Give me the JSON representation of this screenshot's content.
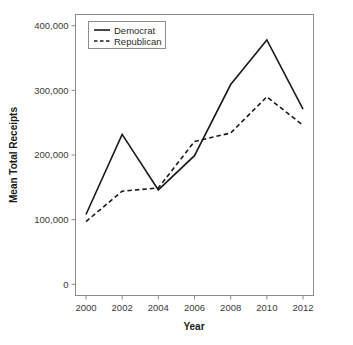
{
  "chart_data": {
    "type": "line",
    "title": "",
    "xlabel": "Year",
    "ylabel": "Mean Total Receipts",
    "x": [
      2000,
      2002,
      2004,
      2006,
      2008,
      2010,
      2012
    ],
    "xtick_labels": [
      "2000",
      "2002",
      "2004",
      "2006",
      "2008",
      "2010",
      "2012"
    ],
    "ytick_labels": [
      "0",
      "100,000",
      "200,000",
      "300,000",
      "400,000"
    ],
    "ytick_values": [
      0,
      100000,
      200000,
      300000,
      400000
    ],
    "xlim": [
      2000,
      2012
    ],
    "ylim": [
      0,
      400000
    ],
    "grid": false,
    "legend_position": "top-left",
    "series": [
      {
        "name": "Democrat",
        "style": "solid",
        "color": "#1a1a1a",
        "values": [
          108000,
          232000,
          146000,
          199000,
          309000,
          378000,
          271000
        ]
      },
      {
        "name": "Republican",
        "style": "dashed",
        "color": "#1a1a1a",
        "values": [
          97000,
          144000,
          149000,
          221000,
          234000,
          290000,
          246000
        ]
      }
    ]
  },
  "legend": {
    "entries": [
      {
        "label": "Democrat",
        "style": "solid"
      },
      {
        "label": "Republican",
        "style": "dashed"
      }
    ]
  },
  "axes": {
    "x_title": "Year",
    "y_title": "Mean Total Receipts"
  }
}
